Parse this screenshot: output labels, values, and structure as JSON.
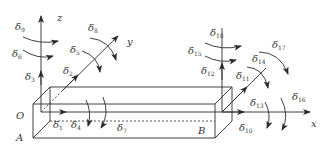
{
  "diagram": {
    "type": "beam-element-dof-diagram",
    "axes": {
      "z": "z",
      "y": "y",
      "x": "x"
    },
    "points": {
      "origin": "O",
      "A": "A",
      "B": "B"
    },
    "dof_labels": {
      "d1": {
        "base": "δ",
        "sub": "1"
      },
      "d2": {
        "base": "δ",
        "sub": "2"
      },
      "d3": {
        "base": "δ",
        "sub": "3"
      },
      "d4": {
        "base": "δ",
        "sub": "4"
      },
      "d5": {
        "base": "δ",
        "sub": "5"
      },
      "d6": {
        "base": "δ",
        "sub": "6"
      },
      "d7": {
        "base": "δ",
        "sub": "7"
      },
      "d8": {
        "base": "δ",
        "sub": "8"
      },
      "d9": {
        "base": "δ",
        "sub": "9"
      },
      "d10": {
        "base": "δ",
        "sub": "10"
      },
      "d11": {
        "base": "δ",
        "sub": "11"
      },
      "d12": {
        "base": "δ",
        "sub": "12"
      },
      "d13": {
        "base": "δ",
        "sub": "13"
      },
      "d14": {
        "base": "δ",
        "sub": "14"
      },
      "d15": {
        "base": "δ",
        "sub": "15"
      },
      "d16": {
        "base": "δ",
        "sub": "16"
      },
      "d17": {
        "base": "δ",
        "sub": "17"
      },
      "d18": {
        "base": "δ",
        "sub": "18"
      }
    },
    "colors": {
      "stroke": "#2a2a2a",
      "text": "#333333",
      "background": "#ffffff"
    }
  }
}
